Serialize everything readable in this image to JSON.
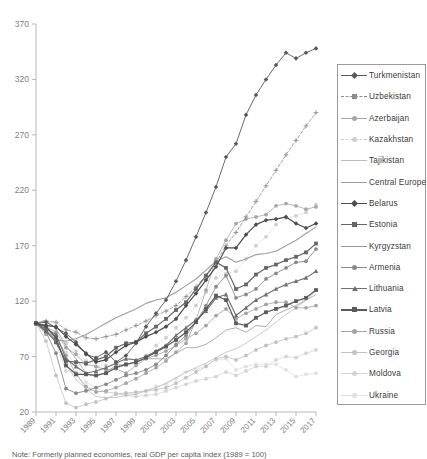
{
  "chart_data": {
    "type": "line",
    "title": "",
    "xlabel": "",
    "ylabel": "",
    "ylim": [
      20,
      370
    ],
    "yticks": [
      20,
      70,
      120,
      170,
      220,
      270,
      320,
      370
    ],
    "grid": false,
    "legend_position": "right-inside",
    "x": [
      1989,
      1990,
      1991,
      1992,
      1993,
      1994,
      1995,
      1996,
      1997,
      1998,
      1999,
      2000,
      2001,
      2002,
      2003,
      2004,
      2005,
      2006,
      2007,
      2008,
      2009,
      2010,
      2011,
      2012,
      2013,
      2014,
      2015,
      2016,
      2017
    ],
    "xticks": [
      "1989",
      "1991",
      "1993",
      "1995",
      "1997",
      "1999",
      "2001",
      "2003",
      "2005",
      "2007",
      "2009",
      "2011",
      "2013",
      "2015",
      "2017"
    ],
    "series": [
      {
        "name": "Turkmenistan",
        "color": "#595959",
        "marker": "diamond",
        "width": 0.9,
        "values": [
          100,
          101,
          96,
          91,
          83,
          72,
          69,
          74,
          65,
          71,
          82,
          97,
          109,
          121,
          138,
          157,
          178,
          200,
          223,
          250,
          262,
          288,
          306,
          320,
          333,
          344,
          339,
          344,
          348
        ]
      },
      {
        "name": "Uzbekistan",
        "color": "#8c8c8c",
        "marker": "plus",
        "width": 0.8,
        "dash": "3 2",
        "values": [
          100,
          102,
          101,
          94,
          92,
          87,
          86,
          88,
          90,
          94,
          98,
          102,
          107,
          111,
          116,
          124,
          133,
          143,
          155,
          170,
          182,
          196,
          210,
          224,
          238,
          252,
          265,
          278,
          290
        ]
      },
      {
        "name": "Azerbaijan",
        "color": "#a6a6a6",
        "marker": "circle",
        "width": 0.8,
        "values": [
          100,
          90,
          89,
          71,
          54,
          43,
          38,
          39,
          42,
          46,
          50,
          55,
          60,
          66,
          74,
          82,
          103,
          130,
          158,
          175,
          190,
          194,
          196,
          198,
          206,
          208,
          206,
          203,
          205
        ]
      },
      {
        "name": "Kazakhstan",
        "color": "#cfcfcf",
        "marker": "circle",
        "width": 0.8,
        "dash": "1 2",
        "values": [
          100,
          98,
          87,
          82,
          75,
          66,
          61,
          62,
          63,
          62,
          64,
          71,
          80,
          87,
          96,
          105,
          116,
          128,
          141,
          145,
          147,
          158,
          170,
          178,
          189,
          195,
          197,
          200,
          207
        ]
      },
      {
        "name": "Tajikistan",
        "color": "#bdbdbd",
        "marker": "none",
        "width": 0.8,
        "values": [
          100,
          98,
          85,
          63,
          49,
          41,
          34,
          33,
          33,
          35,
          36,
          39,
          42,
          46,
          51,
          56,
          60,
          64,
          69,
          74,
          77,
          82,
          88,
          94,
          101,
          108,
          114,
          121,
          129
        ]
      },
      {
        "name": "Central Europe",
        "color": "#9e9e9e",
        "marker": "dash",
        "width": 1.1,
        "values": [
          100,
          94,
          85,
          84,
          86,
          90,
          95,
          100,
          105,
          109,
          113,
          118,
          121,
          123,
          128,
          134,
          140,
          148,
          156,
          160,
          155,
          158,
          162,
          163,
          165,
          170,
          175,
          181,
          187
        ]
      },
      {
        "name": "Belarus",
        "color": "#4d4d4d",
        "marker": "diamond",
        "width": 1.2,
        "values": [
          100,
          98,
          97,
          88,
          81,
          73,
          65,
          67,
          74,
          80,
          83,
          88,
          92,
          97,
          104,
          116,
          127,
          139,
          151,
          168,
          168,
          180,
          189,
          193,
          194,
          196,
          190,
          186,
          190
        ]
      },
      {
        "name": "Estonia",
        "color": "#666666",
        "marker": "square",
        "width": 1.2,
        "values": [
          100,
          93,
          83,
          66,
          65,
          64,
          67,
          70,
          78,
          82,
          83,
          91,
          97,
          104,
          112,
          119,
          131,
          143,
          155,
          150,
          131,
          135,
          144,
          150,
          153,
          157,
          160,
          164,
          172
        ]
      },
      {
        "name": "Kyrgyzstan",
        "color": "#9a9a9a",
        "marker": "none",
        "width": 0.8,
        "values": [
          100,
          103,
          95,
          80,
          68,
          55,
          52,
          56,
          62,
          63,
          65,
          68,
          68,
          68,
          73,
          78,
          78,
          81,
          87,
          94,
          96,
          92,
          98,
          97,
          108,
          112,
          116,
          121,
          126
        ]
      },
      {
        "name": "Armenia",
        "color": "#8a8a8a",
        "marker": "circle",
        "width": 0.9,
        "values": [
          100,
          92,
          73,
          41,
          37,
          39,
          42,
          45,
          49,
          53,
          55,
          58,
          63,
          71,
          81,
          89,
          101,
          116,
          133,
          143,
          123,
          126,
          131,
          140,
          145,
          150,
          155,
          156,
          167
        ]
      },
      {
        "name": "Lithuania",
        "color": "#707070",
        "marker": "triangle",
        "width": 1.1,
        "values": [
          100,
          95,
          90,
          68,
          61,
          55,
          57,
          60,
          64,
          68,
          67,
          70,
          75,
          80,
          89,
          96,
          103,
          111,
          123,
          126,
          107,
          114,
          121,
          126,
          131,
          135,
          138,
          141,
          147
        ]
      },
      {
        "name": "Latvia",
        "color": "#5a5a5a",
        "marker": "square",
        "width": 1.2,
        "values": [
          100,
          97,
          87,
          62,
          54,
          54,
          53,
          55,
          60,
          63,
          65,
          69,
          74,
          79,
          85,
          92,
          101,
          113,
          125,
          121,
          100,
          98,
          105,
          110,
          113,
          116,
          120,
          123,
          130
        ]
      },
      {
        "name": "Russia",
        "color": "#a3a3a3",
        "marker": "circle",
        "width": 0.8,
        "values": [
          100,
          97,
          92,
          78,
          72,
          63,
          61,
          58,
          59,
          55,
          62,
          68,
          71,
          75,
          80,
          86,
          91,
          98,
          107,
          113,
          104,
          109,
          113,
          117,
          119,
          119,
          114,
          114,
          116
        ]
      },
      {
        "name": "Georgia",
        "color": "#c2c2c2",
        "marker": "circle",
        "width": 0.8,
        "values": [
          100,
          84,
          53,
          28,
          24,
          27,
          29,
          32,
          36,
          37,
          38,
          39,
          40,
          42,
          46,
          51,
          56,
          61,
          68,
          70,
          67,
          71,
          76,
          80,
          83,
          86,
          88,
          91,
          96
        ]
      },
      {
        "name": "Moldova",
        "color": "#d4d4d4",
        "marker": "circle",
        "width": 0.8,
        "values": [
          100,
          98,
          82,
          57,
          56,
          40,
          39,
          38,
          37,
          35,
          34,
          35,
          36,
          39,
          42,
          45,
          48,
          50,
          52,
          56,
          53,
          57,
          61,
          61,
          67,
          70,
          69,
          73,
          76
        ]
      },
      {
        "name": "Ukraine",
        "color": "#e0e0e0",
        "marker": "circle",
        "width": 0.8,
        "values": [
          100,
          94,
          85,
          74,
          62,
          47,
          42,
          38,
          37,
          37,
          37,
          39,
          43,
          45,
          50,
          56,
          58,
          62,
          67,
          68,
          58,
          61,
          63,
          63,
          63,
          58,
          52,
          54,
          55
        ]
      }
    ]
  },
  "legend": {
    "items": [
      {
        "label": "Turkmenistan"
      },
      {
        "label": "Uzbekistan"
      },
      {
        "label": "Azerbaijan"
      },
      {
        "label": "Kazakhstan"
      },
      {
        "label": "Tajikistan"
      },
      {
        "label": "Central Europe"
      },
      {
        "label": "Belarus"
      },
      {
        "label": "Estonia"
      },
      {
        "label": "Kyrgyzstan"
      },
      {
        "label": "Armenia"
      },
      {
        "label": "Lithuania"
      },
      {
        "label": "Latvia"
      },
      {
        "label": "Russia"
      },
      {
        "label": "Georgia"
      },
      {
        "label": "Moldova"
      },
      {
        "label": "Ukraine"
      }
    ]
  },
  "caption": {
    "text": "Note: Formerly planned economies, real GDP per capita index (1989 = 100)"
  }
}
